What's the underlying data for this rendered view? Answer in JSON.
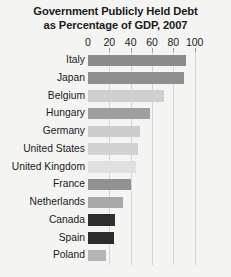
{
  "chart_data": {
    "type": "bar",
    "orientation": "horizontal",
    "title": "Government Publicly Held Debt as Percentage of GDP, 2007",
    "title_lines": [
      "Government Publicly Held Debt",
      "as Percentage of GDP, 2007"
    ],
    "xlabel": "",
    "ylabel": "",
    "xlim": [
      0,
      105
    ],
    "ticks": [
      0,
      20,
      40,
      60,
      80,
      100
    ],
    "tick_labels": [
      "0",
      "20",
      "40",
      "60",
      "80",
      "100"
    ],
    "grid": true,
    "legend": "none",
    "categories": [
      "Italy",
      "Japan",
      "Belgium",
      "Hungary",
      "Germany",
      "United States",
      "United Kingdom",
      "France",
      "Netherlands",
      "Canada",
      "Spain",
      "Poland"
    ],
    "values": [
      92,
      90,
      71,
      58,
      49,
      47,
      45,
      40,
      33,
      25,
      24,
      17
    ],
    "bar_colors": [
      "#8c8c8c",
      "#8f8f8f",
      "#cfcfcf",
      "#9e9e9e",
      "#cdcdcd",
      "#d2d2d2",
      "#e0e0e0",
      "#919191",
      "#a8a8a8",
      "#2e2e2e",
      "#2b2b2b",
      "#b4b4b4"
    ],
    "background_color": "#f4f4f2",
    "gridline_color": "#d5d5d3",
    "text_color": "#1b1b1b"
  }
}
